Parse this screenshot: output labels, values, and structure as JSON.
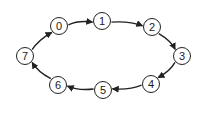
{
  "diagram": {
    "type": "directed-cycle",
    "colors": {
      "stroke": "#222222",
      "fill": "#ffffff",
      "text": "#1a1a1a"
    },
    "nodes": [
      {
        "id": "0",
        "label": "0",
        "x": 59,
        "y": 26
      },
      {
        "id": "1",
        "label": "1",
        "x": 102,
        "y": 21
      },
      {
        "id": "2",
        "label": "2",
        "x": 152,
        "y": 27
      },
      {
        "id": "3",
        "label": "3",
        "x": 182,
        "y": 56
      },
      {
        "id": "4",
        "label": "4",
        "x": 151,
        "y": 84
      },
      {
        "id": "5",
        "label": "5",
        "x": 103,
        "y": 90
      },
      {
        "id": "6",
        "label": "6",
        "x": 58,
        "y": 85
      },
      {
        "id": "7",
        "label": "7",
        "x": 25,
        "y": 56
      }
    ],
    "edges": [
      {
        "from": "0",
        "to": "1"
      },
      {
        "from": "1",
        "to": "2"
      },
      {
        "from": "2",
        "to": "3"
      },
      {
        "from": "3",
        "to": "4"
      },
      {
        "from": "4",
        "to": "5"
      },
      {
        "from": "5",
        "to": "6"
      },
      {
        "from": "6",
        "to": "7"
      },
      {
        "from": "7",
        "to": "0"
      }
    ]
  }
}
